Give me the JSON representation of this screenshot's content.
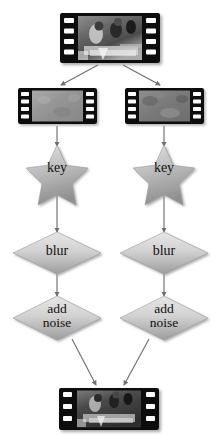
{
  "diagram": {
    "background_color": "#ffffff",
    "edge_color": "#6f6f74",
    "shape_fill_light": "#dcdcdc",
    "shape_fill_dark": "#9a9a9a",
    "shape_stroke": "#8a8a8a",
    "label_color": "#101010",
    "filmstrip_border_color": "#0b0b0b"
  },
  "nodes": {
    "source_clip": {
      "label": "",
      "icon": "filmstrip-color-frame",
      "kind": "filmstrip",
      "sprocket_count": 4,
      "x": 60,
      "y": 13,
      "w": 100,
      "h": 50
    },
    "left_clip": {
      "label": "",
      "icon": "filmstrip-gray-frame",
      "kind": "filmstrip",
      "sprocket_count": 4,
      "x": 18,
      "y": 88,
      "w": 79,
      "h": 36
    },
    "right_clip": {
      "label": "",
      "icon": "filmstrip-gray-frame",
      "kind": "filmstrip",
      "sprocket_count": 4,
      "x": 125,
      "y": 88,
      "w": 79,
      "h": 36
    },
    "left_key": {
      "label": "key",
      "kind": "star",
      "cx": 57,
      "cy": 170
    },
    "right_key": {
      "label": "key",
      "kind": "star",
      "cx": 164,
      "cy": 170
    },
    "left_blur": {
      "label": "blur",
      "kind": "diamond",
      "cx": 57,
      "cy": 253
    },
    "right_blur": {
      "label": "blur",
      "kind": "diamond",
      "cx": 164,
      "cy": 253
    },
    "left_add_noise": {
      "label": "add\nnoise",
      "kind": "diamond",
      "cx": 57,
      "cy": 318
    },
    "right_add_noise": {
      "label": "add\nnoise",
      "kind": "diamond",
      "cx": 164,
      "cy": 318
    },
    "output_clip": {
      "label": "",
      "icon": "filmstrip-color-frame",
      "kind": "filmstrip",
      "sprocket_count": 3,
      "x": 59,
      "y": 388,
      "w": 100,
      "h": 42
    }
  },
  "edges": [
    {
      "from": "source_clip",
      "to": "left_clip",
      "name": "edge-source-to-left-clip"
    },
    {
      "from": "source_clip",
      "to": "right_clip",
      "name": "edge-source-to-right-clip"
    },
    {
      "from": "left_clip",
      "to": "left_key",
      "name": "edge-left-clip-to-key"
    },
    {
      "from": "right_clip",
      "to": "right_key",
      "name": "edge-right-clip-to-key"
    },
    {
      "from": "left_key",
      "to": "left_blur",
      "name": "edge-left-key-to-blur"
    },
    {
      "from": "right_key",
      "to": "right_blur",
      "name": "edge-right-key-to-blur"
    },
    {
      "from": "left_blur",
      "to": "left_add_noise",
      "name": "edge-left-blur-to-add-noise"
    },
    {
      "from": "right_blur",
      "to": "right_add_noise",
      "name": "edge-right-blur-to-add-noise"
    },
    {
      "from": "left_add_noise",
      "to": "output_clip",
      "name": "edge-left-add-noise-to-output"
    },
    {
      "from": "right_add_noise",
      "to": "output_clip",
      "name": "edge-right-add-noise-to-output"
    }
  ]
}
